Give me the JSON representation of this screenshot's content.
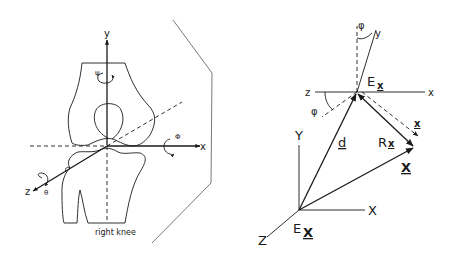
{
  "left_diagram": {
    "caption": "right knee",
    "axes": {
      "x": "x",
      "y": "y",
      "z": "z"
    },
    "rotations": {
      "psi": "ψ",
      "phi": "Φ",
      "theta": "θ"
    }
  },
  "right_diagram": {
    "local_frame": {
      "origin": "E",
      "origin_sub": "x",
      "x": "x",
      "y": "y",
      "z": "z",
      "angle_top": "φ",
      "angle_left": "φ"
    },
    "global_frame": {
      "origin": "E",
      "origin_sub": "X",
      "X": "X",
      "Y": "Y",
      "Z": "Z"
    },
    "vectors": {
      "d": "d",
      "x": "x",
      "Rx_R": "R",
      "Rx_x": "x",
      "X": "X"
    }
  },
  "colors": {
    "ink": "#1a1a1a",
    "plane": "#6a6a6a",
    "background": "#ffffff"
  }
}
